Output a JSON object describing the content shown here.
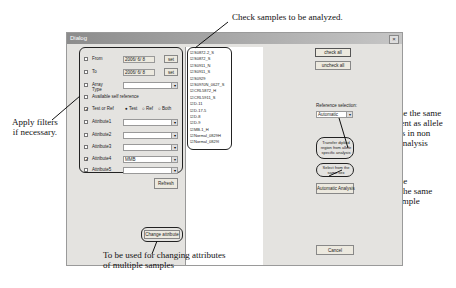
{
  "annotations": {
    "check_samples": "Check samples to be analyzed.",
    "apply_filters": [
      "Apply filters",
      "if necessary."
    ],
    "same_diploid": [
      "Check here to use the same",
      "diploid assignment as allele",
      "-specific analysis in non",
      "-allele-specific analysis"
    ],
    "same_gender": [
      "Check here to use",
      "references with the same",
      "gender as test sample"
    ],
    "change_attr": [
      "To be used for changing attributes",
      "of multiple samples"
    ]
  },
  "dialog": {
    "title": "Dialog",
    "close_glyph": "×",
    "filters": {
      "from": {
        "label": "From",
        "value": "2006/ 6/ 8",
        "button": "set",
        "checked": false
      },
      "to": {
        "label": "To",
        "value": "2006/ 6/ 8",
        "button": "set",
        "checked": false
      },
      "array_type": {
        "label": "Array Type",
        "value": "",
        "checked": false
      },
      "available_self_reference": {
        "label": "Available self reference",
        "checked": false
      },
      "test_or_ref": {
        "label": "Test or Ref",
        "checked": true,
        "options": [
          "Test",
          "Ref",
          "Both"
        ],
        "selected": "Test"
      },
      "attributes": [
        {
          "label": "Attribute1",
          "value": "",
          "checked": false
        },
        {
          "label": "Attribute2",
          "value": "",
          "checked": false
        },
        {
          "label": "Attribute3",
          "value": "",
          "checked": false
        },
        {
          "label": "Attribute4",
          "value": "MMB",
          "checked": true
        },
        {
          "label": "Attribute5",
          "value": "",
          "checked": false
        }
      ],
      "refresh": "Refresh"
    },
    "change_attribute": "Change attribute",
    "samples": [
      "S0872-2_S",
      "S0872_S",
      "S0911_N",
      "S0911_S",
      "S0929",
      "S0970N_0627_S",
      "CRL5872_H",
      "CRL5911_S",
      "D-11",
      "D-17-5",
      "D-8",
      "D-9",
      "MB-1_H",
      "Normal_0829H",
      "Normal_0829I"
    ],
    "check_all": "check all",
    "uncheck_all": "uncheck all",
    "reference_selection": {
      "label": "Reference selection:",
      "value": "Automatic"
    },
    "transfer_diploid": "Transfer diploid region from allele specific analysis",
    "select_same_sex": "Select from the same sex",
    "automatic_analysis": "Automatic Analysis",
    "cancel": "Cancel"
  }
}
